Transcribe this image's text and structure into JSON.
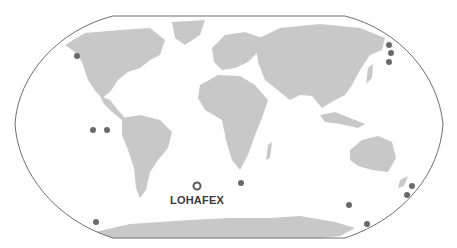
{
  "map": {
    "projection": "robinson-like world map",
    "colors": {
      "ocean": "#ffffff",
      "land": "#c8c8c8",
      "border": "#6e6e6e",
      "site_dot": "#6a6a6a",
      "highlight_ring": "#5a5a5a",
      "label": "#3a3a3a"
    },
    "highlight": {
      "label": "LOHAFEX",
      "x": 197,
      "y": 186
    },
    "sites": [
      {
        "x": 77,
        "y": 56
      },
      {
        "x": 389,
        "y": 45
      },
      {
        "x": 391,
        "y": 53
      },
      {
        "x": 389,
        "y": 62
      },
      {
        "x": 93,
        "y": 130
      },
      {
        "x": 107,
        "y": 130
      },
      {
        "x": 241,
        "y": 183
      },
      {
        "x": 349,
        "y": 205
      },
      {
        "x": 412,
        "y": 186
      },
      {
        "x": 407,
        "y": 195
      },
      {
        "x": 367,
        "y": 224
      },
      {
        "x": 96,
        "y": 222
      }
    ]
  }
}
